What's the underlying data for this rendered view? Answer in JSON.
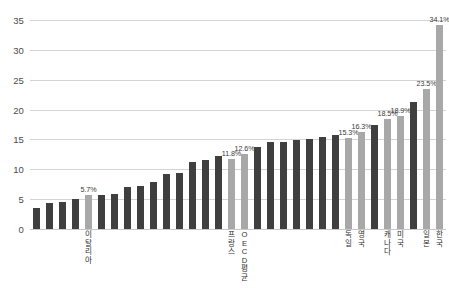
{
  "chart_data": {
    "type": "bar",
    "title": "",
    "subtitle": "",
    "xlabel": "",
    "ylabel": "",
    "ylim": [
      0,
      35
    ],
    "ytick_values": [
      0,
      5,
      10,
      15,
      20,
      25,
      30,
      35
    ],
    "ytick_labels": [
      "0",
      "5",
      "10",
      "15",
      "20",
      "25",
      "30",
      "35"
    ],
    "grid": true,
    "legend": "none",
    "value_unit": "%",
    "highlight_color": "#a8a8a8",
    "bar_color": "#3f3f3f",
    "gridline_color": "#d4d4d4",
    "categories": [
      "",
      "",
      "",
      "",
      "이탈리아",
      "",
      "",
      "",
      "",
      "",
      "",
      "",
      "",
      "",
      "",
      "프랑스",
      "OECD 평균",
      "",
      "",
      "",
      "",
      "",
      "",
      "",
      "독일",
      "영국",
      "",
      "캐나다",
      "미국",
      "",
      "일본",
      "한국"
    ],
    "values": [
      3.5,
      4.3,
      4.5,
      5.0,
      5.7,
      5.7,
      5.8,
      7.0,
      7.2,
      7.8,
      9.2,
      9.3,
      11.3,
      11.6,
      12.3,
      11.8,
      12.6,
      13.8,
      14.5,
      14.5,
      14.9,
      15.1,
      15.4,
      15.8,
      15.3,
      16.3,
      17.4,
      18.5,
      18.9,
      21.3,
      23.5,
      34.1
    ],
    "highlighted": [
      false,
      false,
      false,
      false,
      true,
      false,
      false,
      false,
      false,
      false,
      false,
      false,
      false,
      false,
      false,
      true,
      true,
      false,
      false,
      false,
      false,
      false,
      false,
      false,
      true,
      true,
      false,
      true,
      true,
      false,
      true,
      true
    ],
    "point_labels": [
      "",
      "",
      "",
      "",
      "5.7%",
      "",
      "",
      "",
      "",
      "",
      "",
      "",
      "",
      "",
      "",
      "11.8%",
      "12.6%",
      "",
      "",
      "",
      "",
      "",
      "",
      "",
      "15.3%",
      "16.3%",
      "",
      "18.5%",
      "18.9%",
      "",
      "23.5%",
      "34.1%"
    ]
  }
}
